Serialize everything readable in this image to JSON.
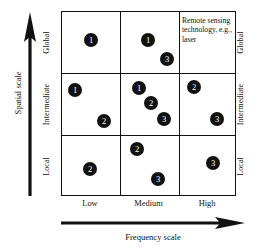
{
  "figure": {
    "type": "matrix-scatter",
    "background_color": "#ffffff",
    "line_color": "#111111",
    "dot_color": "#111111",
    "dot_label_color": "#ffffff"
  },
  "axes": {
    "y": {
      "title": "Spatial scale",
      "arrow": "up-arrow-icon",
      "ticks": [
        "Local",
        "Intermediate",
        "Global"
      ],
      "ticks_top_to_bottom": [
        "Global",
        "Intermediate",
        "Local"
      ]
    },
    "x": {
      "title": "Frequency scale",
      "arrow": "right-arrow-icon",
      "ticks": [
        "Low",
        "Medium",
        "High"
      ]
    }
  },
  "annotation": {
    "text": "Remote sensing technology, e.g., laser",
    "cell": "High / Global"
  },
  "chart_data": {
    "type": "scatter",
    "title": "",
    "xlabel": "Frequency scale",
    "ylabel": "Spatial scale",
    "x_categories": [
      "Low",
      "Medium",
      "High"
    ],
    "y_categories": [
      "Local",
      "Intermediate",
      "Global"
    ],
    "grid": true,
    "legend": "none",
    "annotations": [
      {
        "text": "Remote sensing technology, e.g., laser",
        "x_category": "High",
        "y_category": "Global"
      }
    ],
    "points": [
      {
        "label": "1",
        "x_category": "Low",
        "y_category": "Global",
        "px": 29,
        "py": 28
      },
      {
        "label": "1",
        "x_category": "Medium",
        "y_category": "Global",
        "px": 27,
        "py": 28
      },
      {
        "label": "3",
        "x_category": "Medium",
        "y_category": "Global",
        "px": 46,
        "py": 47
      },
      {
        "label": "1",
        "x_category": "Low",
        "y_category": "Intermediate",
        "px": 13,
        "py": 16
      },
      {
        "label": "2",
        "x_category": "Low",
        "y_category": "Intermediate",
        "px": 42,
        "py": 47
      },
      {
        "label": "1",
        "x_category": "Medium",
        "y_category": "Intermediate",
        "px": 18,
        "py": 14
      },
      {
        "label": "2",
        "x_category": "Medium",
        "y_category": "Intermediate",
        "px": 30,
        "py": 29
      },
      {
        "label": "3",
        "x_category": "Medium",
        "y_category": "Intermediate",
        "px": 43,
        "py": 45
      },
      {
        "label": "2",
        "x_category": "High",
        "y_category": "Intermediate",
        "px": 14,
        "py": 13
      },
      {
        "label": "3",
        "x_category": "High",
        "y_category": "Intermediate",
        "px": 37,
        "py": 45
      },
      {
        "label": "2",
        "x_category": "Low",
        "y_category": "Local",
        "px": 28,
        "py": 33
      },
      {
        "label": "2",
        "x_category": "Medium",
        "y_category": "Local",
        "px": 16,
        "py": 13
      },
      {
        "label": "3",
        "x_category": "Medium",
        "y_category": "Local",
        "px": 37,
        "py": 43
      },
      {
        "label": "3",
        "x_category": "High",
        "y_category": "Local",
        "px": 33,
        "py": 27
      }
    ]
  }
}
